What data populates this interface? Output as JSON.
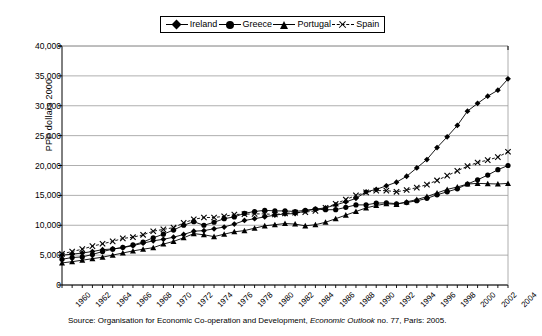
{
  "chart_data": {
    "type": "line",
    "title": "",
    "xlabel": "",
    "ylabel": "PPP dollars 2000",
    "ylim": [
      0,
      40000
    ],
    "ytick_step": 5000,
    "yticks": [
      "0",
      "5,000",
      "10,000",
      "15,000",
      "20,000",
      "25,000",
      "30,000",
      "35,000",
      "40,000"
    ],
    "grid": true,
    "legend_position": "top-center",
    "x": [
      1960,
      1961,
      1962,
      1963,
      1964,
      1965,
      1966,
      1967,
      1968,
      1969,
      1970,
      1971,
      1972,
      1973,
      1974,
      1975,
      1976,
      1977,
      1978,
      1979,
      1980,
      1981,
      1982,
      1983,
      1984,
      1985,
      1986,
      1987,
      1988,
      1989,
      1990,
      1991,
      1992,
      1993,
      1994,
      1995,
      1996,
      1997,
      1998,
      1999,
      2000,
      2001,
      2002,
      2003,
      2004
    ],
    "xtick_labels": [
      "1960",
      "1962",
      "1964",
      "1966",
      "1968",
      "1970",
      "1972",
      "1974",
      "1976",
      "1978",
      "1980",
      "1982",
      "1984",
      "1986",
      "1988",
      "1990",
      "1992",
      "1994",
      "1996",
      "1998",
      "2000",
      "2002",
      "2004"
    ],
    "series": [
      {
        "name": "Ireland",
        "marker": "diamond",
        "values": [
          5000,
          5150,
          5350,
          5600,
          5900,
          6050,
          6250,
          6600,
          7000,
          7400,
          7650,
          8000,
          8450,
          9000,
          9100,
          9400,
          9700,
          10200,
          10800,
          11100,
          11400,
          11700,
          11900,
          11950,
          12400,
          12700,
          12900,
          13400,
          13900,
          14500,
          15600,
          16000,
          16600,
          17200,
          18200,
          19600,
          21000,
          23000,
          24800,
          26700,
          29100,
          30400,
          31600,
          32600,
          34500
        ]
      },
      {
        "name": "Greece",
        "marker": "circle",
        "values": [
          4300,
          4600,
          4700,
          5100,
          5600,
          6000,
          6300,
          6700,
          7200,
          7900,
          8500,
          9200,
          10000,
          10600,
          10000,
          10500,
          11100,
          11400,
          12000,
          12300,
          12500,
          12400,
          12400,
          12300,
          12500,
          12700,
          12600,
          12600,
          13000,
          13400,
          13400,
          13700,
          13750,
          13600,
          13800,
          14100,
          14500,
          15100,
          15600,
          16100,
          16900,
          17600,
          18400,
          19300,
          20000
        ]
      },
      {
        "name": "Portugal",
        "marker": "triangle",
        "values": [
          3700,
          3900,
          4150,
          4400,
          4650,
          5000,
          5350,
          5700,
          6000,
          6250,
          6850,
          7300,
          7900,
          8600,
          8400,
          8100,
          8500,
          8900,
          9100,
          9500,
          9900,
          10100,
          10300,
          10200,
          9900,
          10100,
          10500,
          11100,
          11700,
          12300,
          12900,
          13300,
          13600,
          13500,
          13900,
          14300,
          14800,
          15400,
          16000,
          16400,
          16900,
          17000,
          16950,
          16900,
          17000
        ]
      },
      {
        "name": "Spain",
        "marker": "x",
        "values": [
          5200,
          5600,
          6000,
          6500,
          6900,
          7300,
          7800,
          8000,
          8400,
          9000,
          9300,
          9600,
          10400,
          11000,
          11300,
          11300,
          11500,
          11800,
          11850,
          11900,
          11900,
          11800,
          12000,
          12100,
          12200,
          12400,
          12900,
          13600,
          14300,
          15000,
          15500,
          15800,
          15800,
          15600,
          15900,
          16300,
          16800,
          17500,
          18300,
          19100,
          19900,
          20500,
          20900,
          21400,
          22300
        ]
      }
    ],
    "source": {
      "prefix": "Source: Organisation for Economic Co-operation and Development, ",
      "italic": "Economic Outlook",
      "suffix": " no. 77, Paris: 2005."
    }
  },
  "legend": {
    "items": [
      {
        "label": "Ireland",
        "icon": "diamond-marker-icon"
      },
      {
        "label": "Greece",
        "icon": "circle-marker-icon"
      },
      {
        "label": "Portugal",
        "icon": "triangle-marker-icon"
      },
      {
        "label": "Spain",
        "icon": "x-marker-icon"
      }
    ]
  },
  "colors": {
    "ink": "#000000",
    "grid": "#9a9a9a",
    "background": "#ffffff"
  }
}
